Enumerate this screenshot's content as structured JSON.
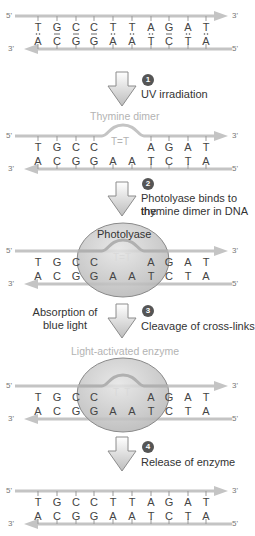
{
  "colors": {
    "strand": "#c4c4c4",
    "enzyme": "#c9c9c9",
    "enzyme_edge": "#8a8a8a",
    "step_badge": "#555555",
    "faded_text": "#b3b3b3"
  },
  "dna": {
    "top_strand": [
      "T",
      "G",
      "C",
      "C",
      "T",
      "T",
      "A",
      "G",
      "A",
      "T"
    ],
    "bottom_strand": [
      "A",
      "C",
      "G",
      "G",
      "A",
      "A",
      "T",
      "C",
      "T",
      "A"
    ],
    "top_label_left": "5'",
    "top_label_right": "3'",
    "bottom_label_left": "3'",
    "bottom_label_right": "5'"
  },
  "panels": [
    {
      "id": "intact-dna",
      "top_bases": [
        "T",
        "G",
        "C",
        "C",
        "T",
        "T",
        "A",
        "G",
        "A",
        "T"
      ]
    },
    {
      "id": "thymine-dimer",
      "caption": "Thymine dimer",
      "top_bases": [
        "T",
        "G",
        "C",
        "C",
        "",
        "",
        "A",
        "G",
        "A",
        "T"
      ],
      "dimer_label": "T=T"
    },
    {
      "id": "photolyase-bound",
      "enzyme_label": "Photolyase",
      "top_bases": [
        "T",
        "G",
        "C",
        "C",
        "",
        "",
        "A",
        "G",
        "A",
        "T"
      ],
      "dimer_label": "T=T"
    },
    {
      "id": "light-activated",
      "caption": "Light-activated enzyme",
      "top_bases": [
        "T",
        "G",
        "C",
        "C",
        "",
        "",
        "A",
        "G",
        "A",
        "T"
      ],
      "dimer_label": "T  T"
    },
    {
      "id": "repaired-dna",
      "top_bases": [
        "T",
        "G",
        "C",
        "C",
        "T",
        "T",
        "A",
        "G",
        "A",
        "T"
      ]
    }
  ],
  "steps": [
    {
      "number": "1",
      "text": "UV irradiation"
    },
    {
      "number": "2",
      "text_line1": "Photolyase binds to the",
      "text_line2": "thymine dimer in DNA"
    },
    {
      "number": "3",
      "text": "Cleavage of cross-links",
      "side_line1": "Absorption of",
      "side_line2": "blue light"
    },
    {
      "number": "4",
      "text": "Release of enzyme"
    }
  ]
}
